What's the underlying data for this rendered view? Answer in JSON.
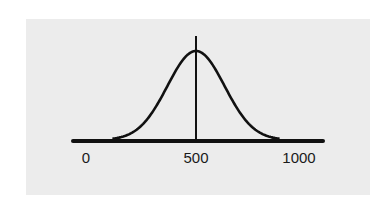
{
  "chart_data": {
    "type": "line",
    "title": "",
    "xlabel": "",
    "ylabel": "",
    "distribution": "normal",
    "mean": 500,
    "std_dev": 130,
    "xlim": [
      0,
      1000
    ],
    "x_ticks": [
      0,
      500,
      1000
    ],
    "tick_labels": [
      "0",
      "500",
      "1000"
    ],
    "annotations": [
      {
        "type": "vertical-line",
        "x": 500,
        "label": "mean"
      }
    ],
    "series": [
      {
        "name": "bell curve",
        "x": [
          130,
          200,
          250,
          300,
          350,
          400,
          450,
          500,
          550,
          600,
          650,
          700,
          750,
          800,
          870
        ],
        "y": [
          0.02,
          0.07,
          0.16,
          0.31,
          0.51,
          0.74,
          0.93,
          1.0,
          0.93,
          0.74,
          0.51,
          0.31,
          0.16,
          0.07,
          0.02
        ]
      }
    ],
    "grid": false,
    "legend": false,
    "colors": {
      "background": "#ececec",
      "line": "#111111"
    }
  },
  "axis": {
    "labels": {
      "min": "0",
      "mid": "500",
      "max": "1000"
    }
  }
}
